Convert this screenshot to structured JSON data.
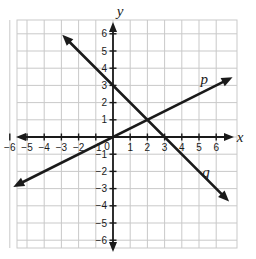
{
  "figure": {
    "type": "coordinate-plane",
    "background_color": "#ffffff",
    "grid_color": "#c9c9c9",
    "axis_color": "#1a1a1a",
    "line_color": "#1a1a1a",
    "text_color": "#1a1a1a"
  },
  "axes": {
    "x_label": "x",
    "y_label": "y",
    "x_ticks": [
      "-6",
      "-5",
      "-4",
      "-3",
      "-2",
      "-1",
      "1",
      "2",
      "3",
      "4",
      "5",
      "6"
    ],
    "y_ticks": [
      "6",
      "5",
      "4",
      "3",
      "2",
      "1",
      "-1",
      "-2",
      "-3",
      "-4",
      "-5",
      "-6"
    ],
    "origin_label": "0",
    "x_range": [
      -7,
      7
    ],
    "y_range": [
      -7,
      7
    ],
    "grid": true
  },
  "chart_data": {
    "type": "line",
    "title": "",
    "xlabel": "x",
    "ylabel": "y",
    "xlim": [
      -7,
      7
    ],
    "ylim": [
      -7,
      7
    ],
    "grid": true,
    "legend": "inline-labels",
    "series": [
      {
        "name": "p",
        "label": "p",
        "slope": 0.5,
        "intercept": 0,
        "equation": "y = 0.5x",
        "points": [
          [
            -5.6,
            -2.8
          ],
          [
            0,
            0
          ],
          [
            2,
            1
          ],
          [
            6.7,
            3.35
          ]
        ],
        "arrows": "both",
        "label_position": [
          5.3,
          3.1
        ]
      },
      {
        "name": "q",
        "label": "q",
        "slope": -1,
        "intercept": 3,
        "equation": "y = -x + 3",
        "points": [
          [
            -2.8,
            5.8
          ],
          [
            0,
            3
          ],
          [
            2,
            1
          ],
          [
            3,
            0
          ],
          [
            6.6,
            -3.6
          ]
        ],
        "arrows": "both",
        "label_position": [
          5.4,
          -2.3
        ]
      }
    ],
    "intersection": [
      2,
      1
    ]
  }
}
